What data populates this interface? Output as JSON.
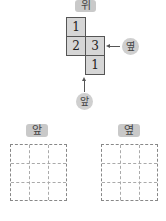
{
  "top_view": {
    "label": "위",
    "cells": [
      {
        "row": 0,
        "col": 0,
        "value": "1"
      },
      {
        "row": 1,
        "col": 0,
        "value": "2"
      },
      {
        "row": 1,
        "col": 1,
        "value": "3"
      },
      {
        "row": 2,
        "col": 1,
        "value": "1"
      }
    ]
  },
  "side_marker": {
    "label": "옆"
  },
  "front_marker": {
    "label": "앞"
  },
  "answer_grids": [
    {
      "label": "앞",
      "rows": 3,
      "cols": 3
    },
    {
      "label": "옆",
      "rows": 3,
      "cols": 3
    }
  ]
}
